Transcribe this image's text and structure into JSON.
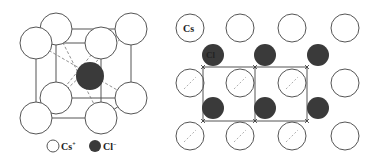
{
  "figure": {
    "left_panel": {
      "title": "CsCl unit cell",
      "cs_ions": [
        {
          "cx": 36,
          "cy": 43
        },
        {
          "cx": 101,
          "cy": 43
        },
        {
          "cx": 36,
          "cy": 118
        },
        {
          "cx": 101,
          "cy": 118
        },
        {
          "cx": 56,
          "cy": 29
        },
        {
          "cx": 131,
          "cy": 29
        },
        {
          "cx": 56,
          "cy": 98
        },
        {
          "cx": 131,
          "cy": 98
        }
      ],
      "cl_ion": {
        "cx": 90,
        "cy": 76
      },
      "legend": {
        "cs_label": "Cs",
        "cs_charge": "+",
        "cl_label": "Cl",
        "cl_charge": "−"
      }
    },
    "right_panel": {
      "title": "CsCl layer projection",
      "cs_label": "Cs",
      "cl_label": "Cl",
      "cs_columns_x": [
        190,
        240,
        292,
        345
      ],
      "cs_rows_y": [
        28,
        83,
        136
      ],
      "cl_columns_x": [
        213,
        265,
        318
      ],
      "cl_rows_y": [
        55,
        108
      ],
      "cell_corners_x": [
        203,
        255,
        307
      ],
      "cell_corners_y": [
        67,
        121
      ]
    },
    "colors": {
      "cs_fill": "#ffffff",
      "cs_stroke": "#555555",
      "cl_fill": "#3a3a3a",
      "line": "#555555",
      "dashed": "#777777"
    }
  }
}
